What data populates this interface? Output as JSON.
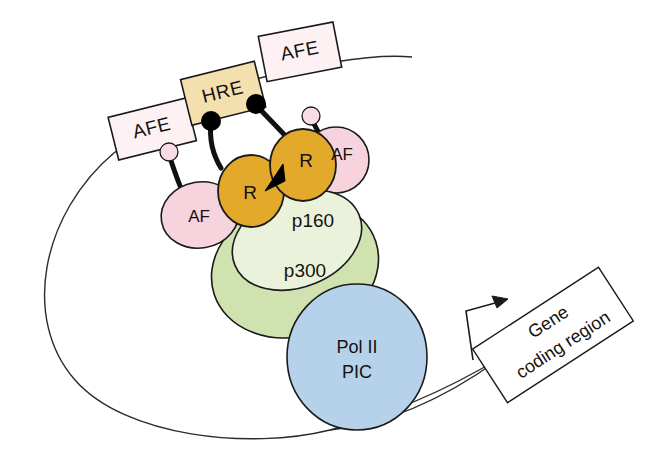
{
  "figure": {
    "background_color": "#ffffff",
    "outline_color": "#1a1a1a"
  },
  "dna": {
    "loop_label": "dna-loop",
    "stroke_color": "#2b2b2b",
    "stroke_width": 1.4
  },
  "elements": {
    "afe_left": {
      "label": "AFE",
      "fill": "#fdf1f4",
      "stroke": "#1a1a1a",
      "rotation_deg": -14
    },
    "hre": {
      "label": "HRE",
      "fill": "#f4dfae",
      "stroke": "#1a1a1a",
      "rotation_deg": -14
    },
    "afe_right": {
      "label": "AFE",
      "fill": "#fdf1f4",
      "stroke": "#1a1a1a",
      "rotation_deg": -11
    },
    "receptor_left": {
      "label": "R",
      "fill": "#e2a92a",
      "stroke": "#1a1a1a"
    },
    "receptor_right": {
      "label": "R",
      "fill": "#e2a92a",
      "stroke": "#1a1a1a"
    },
    "af_left": {
      "label": "AF",
      "fill": "#f6d3dd",
      "stroke": "#1a1a1a"
    },
    "af_right": {
      "label": "AF",
      "fill": "#f6d3dd",
      "stroke": "#1a1a1a"
    },
    "p160": {
      "label": "p160",
      "fill": "#eaf2dc",
      "stroke": "#1a1a1a"
    },
    "p300": {
      "label": "p300",
      "fill": "#cfe2b0",
      "stroke": "#1a1a1a"
    },
    "pol2_pic": {
      "label_line1": "Pol II",
      "label_line2": "PIC",
      "fill": "#b6d2ea",
      "stroke": "#1a1a1a"
    },
    "gene_coding_region": {
      "label_line1": "Gene",
      "label_line2": "coding region",
      "fill": "#ffffff",
      "stroke": "#1a1a1a",
      "rotation_deg": -33
    },
    "tether_node_left": {
      "label": "tether-node",
      "fill": "#f7dce6"
    },
    "tether_node_right": {
      "label": "tether-node",
      "fill": "#f7dce6"
    },
    "hre_contact_dot_left": {
      "fill": "#000000"
    },
    "hre_contact_dot_right": {
      "fill": "#000000"
    },
    "dimer_arrow": {
      "label": "dimerization-arrow",
      "fill": "#000000"
    },
    "transcription_arrow": {
      "label": "transcription-start-arrow",
      "stroke": "#1a1a1a"
    }
  }
}
